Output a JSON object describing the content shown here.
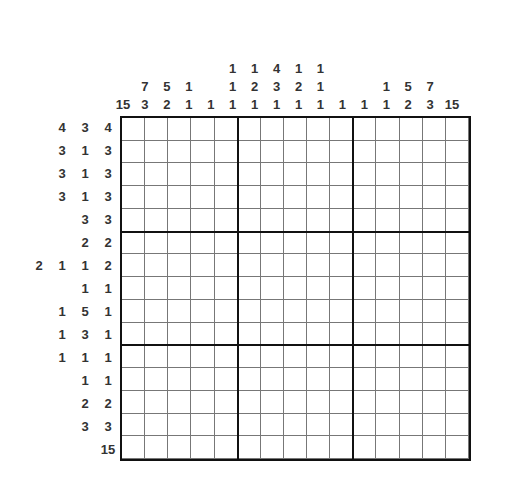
{
  "puzzle": {
    "type": "nonogram",
    "size": {
      "rows": 15,
      "cols": 15
    },
    "column_clues": [
      [
        "15"
      ],
      [
        "7",
        "3"
      ],
      [
        "5",
        "2"
      ],
      [
        "1",
        "1"
      ],
      [
        "1"
      ],
      [
        "1",
        "1",
        "1"
      ],
      [
        "1",
        "2",
        "1"
      ],
      [
        "4",
        "3",
        "1"
      ],
      [
        "1",
        "2",
        "1"
      ],
      [
        "1",
        "1",
        "1"
      ],
      [
        "1"
      ],
      [
        "1"
      ],
      [
        "1",
        "1"
      ],
      [
        "5",
        "2"
      ],
      [
        "7",
        "3"
      ],
      [
        "15"
      ]
    ],
    "row_clues": [
      [
        "4",
        "3",
        "4"
      ],
      [
        "3",
        "1",
        "3"
      ],
      [
        "3",
        "1",
        "3"
      ],
      [
        "3",
        "1",
        "3"
      ],
      [
        "3",
        "3"
      ],
      [
        "2",
        "2"
      ],
      [
        "2",
        "1",
        "1",
        "2"
      ],
      [
        "1",
        "1"
      ],
      [
        "1",
        "5",
        "1"
      ],
      [
        "1",
        "3",
        "1"
      ],
      [
        "1",
        "1",
        "1"
      ],
      [
        "1",
        "1"
      ],
      [
        "2",
        "2"
      ],
      [
        "3",
        "3"
      ],
      [
        "15"
      ]
    ]
  }
}
